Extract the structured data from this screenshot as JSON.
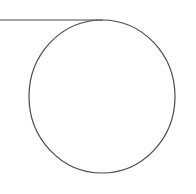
{
  "diagram": {
    "width": 196,
    "height": 194,
    "background": "#ffffff",
    "stroke_color": "#4a4a4a",
    "stroke_width": 1.2,
    "line": {
      "x1": 0,
      "y1": 20,
      "x2": 102,
      "y2": 20
    },
    "circle": {
      "cx": 102,
      "cy": 96.5,
      "rx": 73,
      "ry": 76.5
    }
  }
}
